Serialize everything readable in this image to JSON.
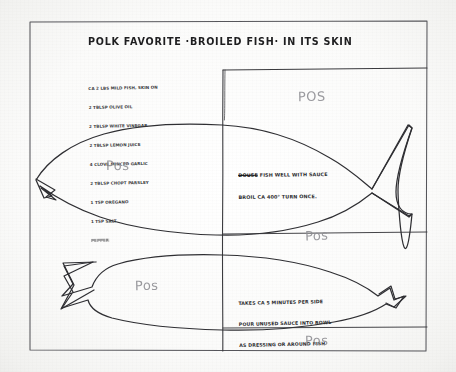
{
  "document": {
    "kind": "handwritten-recipe-card-scan",
    "title": "POLK FAVORITE ·BROILED FISH· IN ITS SKIN",
    "ink_color": "#2a2a2c",
    "pencil_color": "#8d8d92",
    "paper_color": "#fbfbfa",
    "border_color": "#4a4a4d"
  },
  "ingredients": {
    "lines": [
      "CA 2 LBS MILD FISH, SKIN ON",
      "2 TBLSP OLIVE OIL",
      "2 TBLSP WHITE VINEGAR",
      "2 TBLSP LEMON JUICE",
      "4 CLOVE MINCED GARLIC",
      "2 TBLSP CHOPT PARSLEY",
      "1 TSP OREGANO",
      "1 TSP SALT"
    ],
    "smudged_line": "PEPPER"
  },
  "notes": {
    "broil": {
      "struck_word": "DOUSE",
      "lines": [
        " FISH WELL WITH SAUCE",
        "BROIL CA 400° TURN ONCE."
      ]
    },
    "timing": {
      "lines": [
        "TAKES CA 5 MINUTES PER SIDE",
        "POUR UNUSED SAUCE INTO BOWL",
        "AS DRESSING OR AROUND FISH"
      ]
    }
  },
  "pencil_marks": [
    {
      "id": "pos-1",
      "label": "POS"
    },
    {
      "id": "pos-2",
      "label": "Pos"
    },
    {
      "id": "pos-3",
      "label": "Pos"
    },
    {
      "id": "pos-4",
      "label": "Pos"
    },
    {
      "id": "pos-5",
      "label": "Pos"
    }
  ],
  "drawing": {
    "shapes": [
      "card-border-rectangle",
      "upper-fish-outline",
      "lower-fish-outline",
      "vertical-fold-line",
      "upper-horizontal-fold-line",
      "lower-horizontal-fold-line"
    ]
  }
}
